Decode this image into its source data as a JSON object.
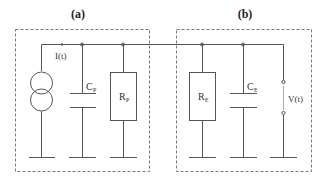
{
  "panels": [
    {
      "id": "a",
      "label": "(a)"
    },
    {
      "id": "b",
      "label": "(b)"
    }
  ],
  "components": {
    "current_source": {
      "label": "I(t)",
      "type": "current-source"
    },
    "cp": {
      "label": "C",
      "sub": "P",
      "type": "capacitor"
    },
    "rp": {
      "label": "R",
      "sub": "P",
      "type": "resistor"
    },
    "re": {
      "label": "R",
      "sub": "E",
      "type": "resistor"
    },
    "ce": {
      "label": "C",
      "sub": "E",
      "type": "capacitor"
    },
    "voltage": {
      "label": "V(t)",
      "type": "voltage-terminals"
    }
  },
  "colors": {
    "wire": "#555555",
    "box": "#777777",
    "text": "#333333"
  }
}
